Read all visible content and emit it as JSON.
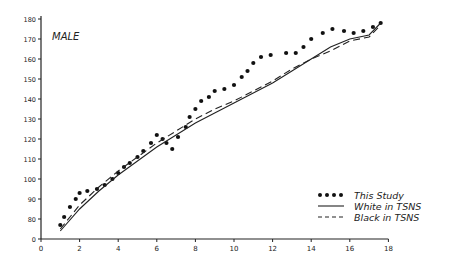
{
  "chart_data": {
    "type": "line",
    "title": "MALE",
    "xlabel": "",
    "ylabel": "",
    "xlim": [
      0,
      18
    ],
    "ylim_ticks": [
      0,
      80,
      90,
      100,
      110,
      120,
      130,
      140,
      150,
      160,
      170,
      180
    ],
    "x_ticks": [
      0,
      2,
      4,
      6,
      8,
      10,
      12,
      14,
      16,
      18
    ],
    "y_axis_break": "axis jumps from 0 to 80",
    "grid": false,
    "legend_position": "lower right",
    "series": [
      {
        "name": "This Study",
        "style": "dotted-markers",
        "x": [
          1.0,
          1.2,
          1.5,
          1.8,
          2.0,
          2.4,
          2.9,
          3.3,
          3.7,
          4.0,
          4.3,
          4.6,
          5.0,
          5.3,
          5.7,
          6.0,
          6.3,
          6.5,
          6.8,
          7.1,
          7.5,
          7.7,
          8.0,
          8.3,
          8.7,
          9.0,
          9.5,
          10.0,
          10.4,
          10.7,
          11.0,
          11.4,
          11.9,
          12.7,
          13.2,
          13.6,
          14.0,
          14.6,
          15.1,
          15.7,
          16.2,
          16.7,
          17.2,
          17.6
        ],
        "y": [
          77,
          81,
          86,
          90,
          93,
          94,
          95,
          97,
          100,
          103,
          106,
          108,
          111,
          114,
          118,
          122,
          120,
          118,
          115,
          121,
          126,
          131,
          135,
          139,
          141,
          144,
          145,
          147,
          151,
          154,
          158,
          161,
          162,
          163,
          163,
          166,
          170,
          173,
          175,
          174,
          173,
          174,
          176,
          178
        ]
      },
      {
        "name": "White in TSNS",
        "style": "solid",
        "x": [
          1,
          2,
          3,
          4,
          5,
          6,
          7,
          8,
          9,
          10,
          11,
          12,
          13,
          14,
          15,
          16,
          17,
          17.6
        ],
        "y": [
          74,
          85,
          94,
          102,
          109,
          116,
          122,
          128,
          133,
          138,
          143,
          148,
          154,
          160,
          166,
          170,
          172,
          178
        ]
      },
      {
        "name": "Black in TSNS",
        "style": "dashed",
        "x": [
          1,
          2,
          3,
          4,
          5,
          6,
          7,
          8,
          9,
          10,
          11,
          12,
          13,
          14,
          15,
          16,
          17,
          17.6
        ],
        "y": [
          75,
          87,
          96,
          104,
          111,
          118,
          124,
          130,
          135,
          139,
          144,
          149,
          155,
          160,
          164,
          169,
          171,
          177
        ]
      }
    ]
  }
}
